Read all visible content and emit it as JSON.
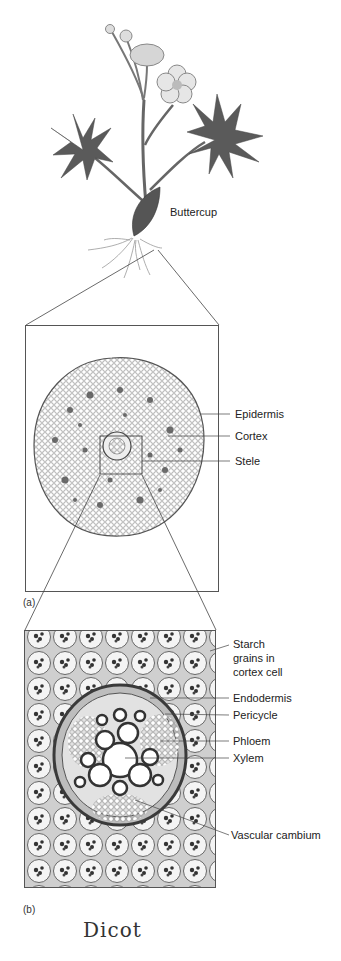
{
  "plant": {
    "label": "Buttercup"
  },
  "panel_a": {
    "tag": "(a)",
    "labels": [
      "Epidermis",
      "Cortex",
      "Stele"
    ]
  },
  "panel_b": {
    "tag": "(b)",
    "labels": {
      "starch": [
        "Starch",
        "grains in",
        "cortex cell"
      ],
      "endodermis": "Endodermis",
      "pericycle": "Pericycle",
      "phloem": "Phloem",
      "xylem": "Xylem",
      "cambium": "Vascular cambium"
    }
  },
  "annotation": {
    "handwritten": "Dicot"
  },
  "colors": {
    "line": "#444444",
    "tissue_dark": "#3a3a3a",
    "tissue_light": "#d8d8d8"
  }
}
